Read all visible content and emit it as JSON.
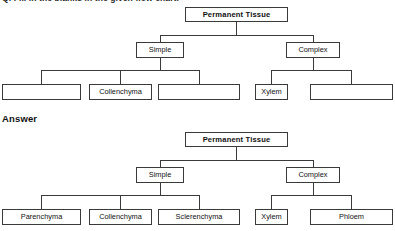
{
  "page": {
    "question_heading": "Q. Fill in the blanks in the given flow chart.",
    "answer_label": "Answer"
  },
  "diagrams": [
    {
      "id": "question-diagram",
      "root": {
        "label": "Permanent Tissue",
        "filled": true
      },
      "branches": [
        {
          "label": "Simple",
          "filled": true,
          "children": [
            {
              "label": "",
              "filled": false
            },
            {
              "label": "Collenchyma",
              "filled": true
            },
            {
              "label": "",
              "filled": false
            }
          ]
        },
        {
          "label": "Complex",
          "filled": true,
          "children": [
            {
              "label": "Xylem",
              "filled": true
            },
            {
              "label": "",
              "filled": false
            }
          ]
        }
      ]
    },
    {
      "id": "answer-diagram",
      "root": {
        "label": "Permanent Tissue",
        "filled": true
      },
      "branches": [
        {
          "label": "Simple",
          "filled": true,
          "children": [
            {
              "label": "Parenchyma",
              "filled": true
            },
            {
              "label": "Collenchyma",
              "filled": true
            },
            {
              "label": "Sclerenchyma",
              "filled": true
            }
          ]
        },
        {
          "label": "Complex",
          "filled": true,
          "children": [
            {
              "label": "Xylem",
              "filled": true
            },
            {
              "label": "Phloem",
              "filled": true
            }
          ]
        }
      ]
    }
  ],
  "colors": {
    "background": "#ffffff",
    "line": "#3a3a3a",
    "text": "#111111"
  }
}
